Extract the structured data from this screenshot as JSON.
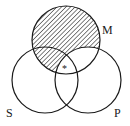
{
  "diagram": {
    "type": "venn-3",
    "circles": [
      {
        "id": "M",
        "label": "M",
        "cx": 66,
        "cy": 40,
        "r": 34
      },
      {
        "id": "S",
        "label": "S",
        "cx": 45,
        "cy": 80,
        "r": 33
      },
      {
        "id": "P",
        "label": "P",
        "cx": 88,
        "cy": 80,
        "r": 33
      }
    ],
    "shaded_region": "M and not P",
    "marker": {
      "symbol": "*",
      "region": "M and S and P"
    },
    "colors": {
      "stroke": "#1a1a1a",
      "hatch": "#1a1a1a",
      "background": "#ffffff"
    }
  }
}
